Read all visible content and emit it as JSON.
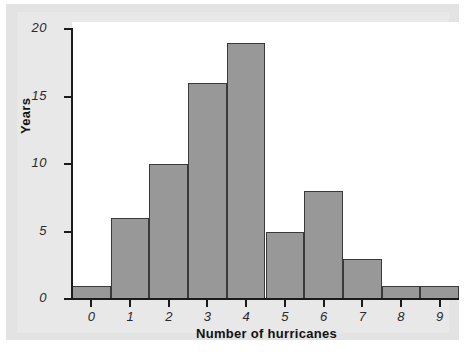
{
  "chart_data": {
    "type": "bar",
    "title": "",
    "subtitle": "",
    "xlabel": "Number of hurricanes",
    "ylabel": "Years",
    "categories": [
      "0",
      "1",
      "2",
      "3",
      "4",
      "5",
      "6",
      "7",
      "8",
      "9"
    ],
    "values": [
      1,
      6,
      10,
      16,
      19,
      5,
      8,
      3,
      1,
      1
    ],
    "series": [
      {
        "name": "Years",
        "values": [
          1,
          6,
          10,
          16,
          19,
          5,
          8,
          3,
          1,
          1
        ]
      }
    ],
    "x_tick_labels": [
      "0",
      "1",
      "2",
      "3",
      "4",
      "5",
      "6",
      "7",
      "8",
      "9"
    ],
    "y_tick_labels": [
      "0",
      "5",
      "10",
      "15",
      "20"
    ],
    "y_ticks": [
      0,
      5,
      10,
      15,
      20
    ],
    "ylim": [
      0,
      20
    ],
    "xlim": [
      -0.5,
      9.5
    ],
    "grid": false,
    "legend": false,
    "bar_fill_color": "#989898",
    "bar_edge_color": "#3a3a3a",
    "axis_color": "#1b1b1b",
    "plot_background_color": "#ffffff",
    "figure_background_color": "#e8e8e8"
  }
}
